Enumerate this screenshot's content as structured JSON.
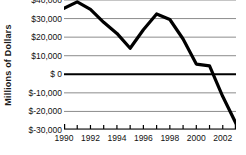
{
  "chart_data": {
    "type": "line",
    "title": "",
    "xlabel": "",
    "ylabel": "Millions of Dollars",
    "ylim": [
      -30000,
      40000
    ],
    "xlim": [
      1990,
      2003
    ],
    "grid": true,
    "legend": false,
    "zero_line": true,
    "y_ticks": [
      40000,
      30000,
      20000,
      10000,
      0,
      -10000,
      -20000,
      -30000
    ],
    "y_tick_labels": [
      "$40,000",
      "$30,000",
      "$20,000",
      "$10,000",
      "$ 0",
      "$-10,000",
      "$-20,000",
      "$-30,000"
    ],
    "x": [
      1990,
      1991,
      1992,
      1993,
      1994,
      1995,
      1996,
      1997,
      1998,
      1999,
      2000,
      2001,
      2002,
      2003
    ],
    "x_tick_labels": [
      "1990",
      "1992",
      "1994",
      "1996",
      "1998",
      "2000",
      "2002"
    ],
    "x_tick_values": [
      1990,
      1992,
      1994,
      1996,
      1998,
      2000,
      2002
    ],
    "series": [
      {
        "name": "Balance",
        "values": [
          35500,
          39000,
          35000,
          28000,
          22000,
          14000,
          24000,
          32500,
          29500,
          19000,
          5500,
          4500,
          -12000,
          -26500
        ],
        "color": "#000000",
        "line_width": 3.2
      }
    ]
  },
  "axis": {
    "y_title": "Millions of Dollars"
  },
  "colors": {
    "background": "#ffffff",
    "gridline": "#8c8c8c",
    "zero_line": "#000000",
    "line": "#000000",
    "text": "#111111"
  }
}
